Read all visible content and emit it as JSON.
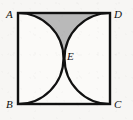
{
  "figure": {
    "kind": "plane-geometry-diagram",
    "canvas": {
      "width": 133,
      "height": 120,
      "background": "#f7f6f4"
    },
    "square": {
      "name": "ABCD",
      "left": 18,
      "top": 13,
      "right": 110,
      "bottom": 104,
      "side": 92,
      "stroke": "#111111",
      "stroke_width": 2.4,
      "fill": "#fbfaf8"
    },
    "vertices": [
      {
        "id": "A",
        "label": "A",
        "corner": "top-left",
        "x": 18,
        "y": 13,
        "label_x": 6,
        "label_y": 9
      },
      {
        "id": "D",
        "label": "D",
        "corner": "top-right",
        "x": 110,
        "y": 13,
        "label_x": 114,
        "label_y": 9
      },
      {
        "id": "B",
        "label": "B",
        "corner": "bottom-left",
        "x": 18,
        "y": 104,
        "label_x": 6,
        "label_y": 99
      },
      {
        "id": "C",
        "label": "C",
        "corner": "bottom-right",
        "x": 110,
        "y": 104,
        "label_x": 114,
        "label_y": 99
      }
    ],
    "intersection_point": {
      "id": "E",
      "label": "E",
      "x": 64,
      "y": 58.5,
      "label_x": 67,
      "label_y": 51
    },
    "arcs": [
      {
        "id": "arc-AB",
        "label": "arc from A to B",
        "from": "A",
        "to": "B",
        "center_x": 18,
        "center_y": 58.5,
        "radius": 45.5,
        "bulge": "right",
        "stroke": "#111111",
        "stroke_width": 2.2,
        "path": "M 18 13 A 45.5 45.5 0 0 1 18 104"
      },
      {
        "id": "arc-DC",
        "label": "arc from D to C",
        "from": "D",
        "to": "C",
        "center_x": 110,
        "center_y": 58.5,
        "radius": 45.5,
        "bulge": "left",
        "stroke": "#111111",
        "stroke_width": 2.2,
        "path": "M 110 13 A 45.5 45.5 0 0 0 110 104"
      }
    ],
    "shaded_region": {
      "id": "region-ADE",
      "label": "shaded region bounded by AD, arc AE and arc DE",
      "fill": "#b9b9b9",
      "path": "M 18 13 L 110 13 A 45.5 45.5 0 0 0 64 58.5 A 45.5 45.5 0 0 0 18 13 Z"
    }
  }
}
